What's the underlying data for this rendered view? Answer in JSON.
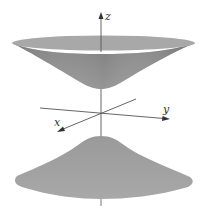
{
  "figure": {
    "axes": {
      "z_label": "z",
      "y_label": "y",
      "x_label": "x"
    },
    "colors": {
      "background": "#ffffff",
      "upper_sheet_rim": "#a9a9a9",
      "upper_sheet_body": "#8e8e8e",
      "lower_sheet": "#a3a3a3",
      "axis": "#555555"
    },
    "sheets": [
      {
        "name": "upper-sheet",
        "opens": "up"
      },
      {
        "name": "lower-sheet",
        "opens": "down"
      }
    ]
  }
}
